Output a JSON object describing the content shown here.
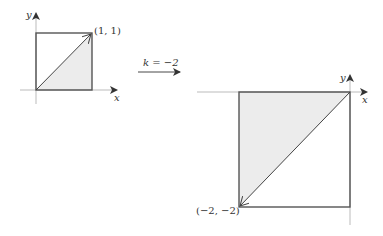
{
  "figure": {
    "left_diagram": {
      "axis_x_label": "x",
      "axis_y_label": "y",
      "point_label": "(1, 1)"
    },
    "transform": {
      "label": "k = −2"
    },
    "right_diagram": {
      "axis_x_label": "x",
      "axis_y_label": "y",
      "point_label": "(−2, −2)"
    },
    "colors": {
      "fill": "#ececec",
      "stroke": "#555555",
      "axis": "#999999"
    }
  }
}
